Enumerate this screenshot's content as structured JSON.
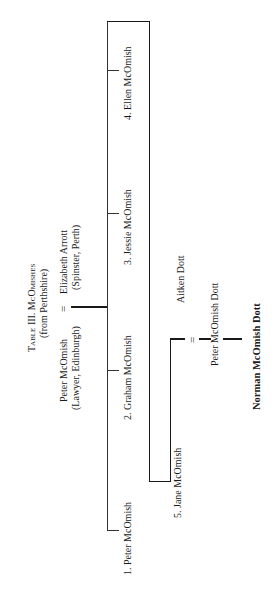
{
  "title": {
    "line1": "Table III. McOmishes",
    "line2": "(from Perthshire)"
  },
  "parents": {
    "father_name": "Peter McOmish",
    "father_detail": "(Lawyer, Edinburgh)",
    "mother_name": "Elizabeth Arrott",
    "mother_detail": "(Spinster, Perth)",
    "marriage_symbol": "="
  },
  "children": [
    {
      "label": "1. Peter McOmish"
    },
    {
      "label": "2. Graham McOmish"
    },
    {
      "label": "3. Jessie McOmish"
    },
    {
      "label": "4. Ellen McOmish"
    },
    {
      "label": "5. Jane McOmish"
    }
  ],
  "jane_marriage": {
    "spouse": "Aitken Dott",
    "marriage_symbol": "=",
    "child": "Peter McOmish Dott",
    "grandchild": "Norman McOmish Dott"
  },
  "colors": {
    "line": "#1a1a1a",
    "text": "#1a1a1a",
    "background": "#ffffff"
  }
}
